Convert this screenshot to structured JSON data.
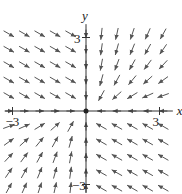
{
  "diagram": {
    "type": "vector-field",
    "axes": {
      "x_label": "x",
      "y_label": "y",
      "x_ticks": [
        {
          "value": -3,
          "label": "−3"
        },
        {
          "value": 3,
          "label": "3"
        }
      ],
      "y_ticks": [
        {
          "value": 3,
          "label": "3"
        },
        {
          "value": -3,
          "label": "−3"
        }
      ],
      "origin_px": [
        86,
        111
      ],
      "scale_px_per_unit": 24.5,
      "range": [
        -3.3,
        3.3
      ]
    },
    "grid": {
      "step": 0.63,
      "count_each_side": 5
    },
    "style": {
      "arrow_color": "#555555",
      "axis_color": "#333333",
      "arrow_length_px": 12
    }
  }
}
